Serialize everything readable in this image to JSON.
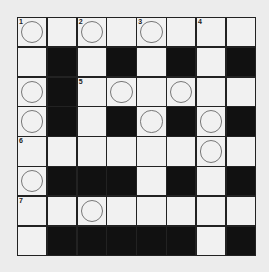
{
  "puzzle": {
    "type": "crossword",
    "rows": 8,
    "cols": 8,
    "grid": [
      [
        "W",
        "W",
        "W",
        "W",
        "W",
        "W",
        "W",
        "W"
      ],
      [
        "W",
        "B",
        "W",
        "B",
        "W",
        "B",
        "W",
        "B"
      ],
      [
        "W",
        "B",
        "W",
        "W",
        "W",
        "W",
        "W",
        "W"
      ],
      [
        "W",
        "B",
        "W",
        "B",
        "W",
        "B",
        "W",
        "B"
      ],
      [
        "W",
        "W",
        "W",
        "W",
        "W",
        "W",
        "W",
        "W"
      ],
      [
        "W",
        "B",
        "B",
        "B",
        "W",
        "B",
        "W",
        "B"
      ],
      [
        "W",
        "W",
        "W",
        "W",
        "W",
        "W",
        "W",
        "W"
      ],
      [
        "W",
        "B",
        "B",
        "B",
        "B",
        "B",
        "W",
        "B"
      ]
    ],
    "numbers": [
      {
        "r": 0,
        "c": 0,
        "n": "1"
      },
      {
        "r": 0,
        "c": 2,
        "n": "2"
      },
      {
        "r": 0,
        "c": 4,
        "n": "3"
      },
      {
        "r": 0,
        "c": 6,
        "n": "4"
      },
      {
        "r": 2,
        "c": 2,
        "n": "5"
      },
      {
        "r": 4,
        "c": 0,
        "n": "6"
      },
      {
        "r": 6,
        "c": 0,
        "n": "7"
      }
    ],
    "circles": [
      [
        0,
        0
      ],
      [
        0,
        2
      ],
      [
        0,
        4
      ],
      [
        2,
        0
      ],
      [
        2,
        3
      ],
      [
        2,
        5
      ],
      [
        3,
        0
      ],
      [
        3,
        4
      ],
      [
        3,
        6
      ],
      [
        4,
        6
      ],
      [
        5,
        0
      ],
      [
        6,
        2
      ]
    ],
    "colors": {
      "background": "#ececec",
      "cell": "#f1f1f1",
      "block": "#111111",
      "line": "#222222",
      "circle": "#777777"
    }
  }
}
